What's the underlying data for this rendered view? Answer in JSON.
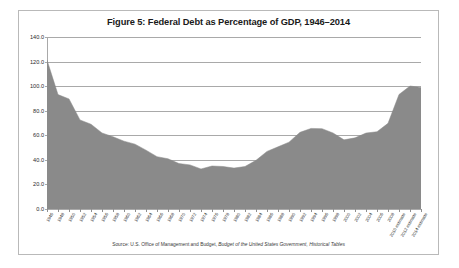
{
  "figure": {
    "title": "Figure 5: Federal Debt as Percentage of GDP, 1946–2014",
    "source_prefix": "Source: U.S. Office of Management and Budget, ",
    "source_italic": "Budget of the United States Government, Historical Tables",
    "border_color": "#b9b9b9",
    "background": "#ffffff"
  },
  "chart_data": {
    "type": "area",
    "title": "Figure 5: Federal Debt as Percentage of GDP, 1946–2014",
    "xlabel": "",
    "ylabel": "",
    "ylim": [
      0,
      140
    ],
    "ytick_step": 20,
    "ytick_labels": [
      "0.0",
      "20.0",
      "40.0",
      "60.0",
      "80.0",
      "100.0",
      "120.0",
      "140.0"
    ],
    "grid": true,
    "legend": "none",
    "series_name": "Federal Debt as Percentage of GDP",
    "area_color": "#8a8a8a",
    "categories": [
      "1946",
      "1948",
      "1950",
      "1952",
      "1954",
      "1956",
      "1958",
      "1960",
      "1962",
      "1964",
      "1966",
      "1968",
      "1970",
      "1972",
      "1974",
      "1976",
      "1978",
      "1980",
      "1982",
      "1984",
      "1986",
      "1988",
      "1990",
      "1992",
      "1994",
      "1996",
      "1998",
      "2000",
      "2002",
      "2004",
      "2006",
      "2008",
      "2010 estimate",
      "2012 estimate",
      "2014 estimate"
    ],
    "values": [
      121.2,
      93.1,
      89.6,
      72.5,
      69.0,
      61.9,
      58.8,
      55.2,
      52.8,
      47.9,
      42.6,
      40.9,
      37.0,
      35.9,
      32.6,
      35.0,
      34.6,
      33.3,
      34.6,
      39.6,
      46.9,
      50.6,
      54.4,
      62.4,
      65.6,
      65.4,
      61.9,
      56.3,
      57.9,
      61.8,
      62.9,
      69.7,
      93.2,
      100.1,
      98.9
    ]
  }
}
